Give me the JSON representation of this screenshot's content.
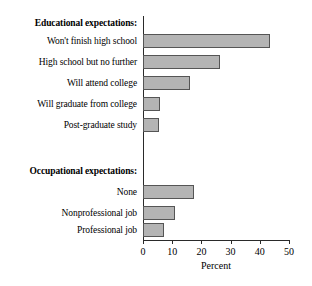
{
  "chart_data": {
    "type": "bar",
    "orientation": "horizontal",
    "title": "",
    "xlabel": "Percent",
    "ylabel": "",
    "xlim": [
      0,
      50
    ],
    "xticks": [
      0,
      10,
      20,
      30,
      40,
      50
    ],
    "xtick_labels": [
      "0",
      "10",
      "20",
      "30",
      "40",
      "50"
    ],
    "grid": false,
    "legend": false,
    "bar_fill_color": "#b4b4b4",
    "bar_edge_color": "#555555",
    "axis_color": "#2a2a2a",
    "groups": [
      {
        "heading": "Educational expectations:",
        "categories": [
          "Won't finish high school",
          "High school but no further",
          "Will attend college",
          "Will graduate from college",
          "Post-graduate study"
        ],
        "values": [
          43.4,
          26.5,
          16.2,
          5.9,
          5.5
        ]
      },
      {
        "heading": "Occupational expectations:",
        "categories": [
          "None",
          "Nonprofessional job",
          "Professional job"
        ],
        "values": [
          17.6,
          11.0,
          7.2
        ]
      }
    ],
    "categories": [
      "Won't finish high school",
      "High school but no further",
      "Will attend college",
      "Will graduate from college",
      "Post-graduate study",
      "None",
      "Nonprofessional job",
      "Professional job"
    ],
    "values": [
      43.4,
      26.5,
      16.2,
      5.9,
      5.5,
      17.6,
      11.0,
      7.2
    ]
  },
  "rows": [
    {
      "label": "Educational expectations:",
      "kind": "heading",
      "top": 14,
      "value": null
    },
    {
      "label": "Won't finish high school",
      "kind": "bar",
      "top": 32,
      "value": 43.4
    },
    {
      "label": "High school but no further",
      "kind": "bar",
      "top": 53,
      "value": 26.5
    },
    {
      "label": "Will attend college",
      "kind": "bar",
      "top": 74,
      "value": 16.2
    },
    {
      "label": "Will graduate from college",
      "kind": "bar",
      "top": 95,
      "value": 5.9
    },
    {
      "label": "Post-graduate study",
      "kind": "bar",
      "top": 116,
      "value": 5.5
    },
    {
      "label": "Occupational expectations:",
      "kind": "heading",
      "top": 162,
      "value": null
    },
    {
      "label": "None",
      "kind": "bar",
      "top": 183,
      "value": 17.6
    },
    {
      "label": "Nonprofessional job",
      "kind": "bar",
      "top": 204,
      "value": 11.0
    },
    {
      "label": "Professional job",
      "kind": "bar",
      "top": 221,
      "value": 7.2
    }
  ],
  "axis": {
    "x_title": "Percent",
    "ticks": [
      {
        "label": "0",
        "value": 0
      },
      {
        "label": "10",
        "value": 10
      },
      {
        "label": "20",
        "value": 20
      },
      {
        "label": "30",
        "value": 30
      },
      {
        "label": "40",
        "value": 40
      },
      {
        "label": "50",
        "value": 50
      }
    ]
  }
}
